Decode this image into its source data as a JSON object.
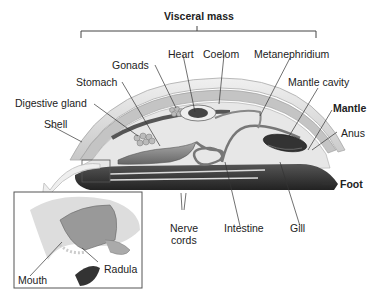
{
  "title": "Visceral mass",
  "labels": {
    "visceral_mass": "Visceral mass",
    "heart": "Heart",
    "coelom": "Coelom",
    "metanephridium": "Metanephridium",
    "gonads": "Gonads",
    "stomach": "Stomach",
    "mantle_cavity": "Mantle cavity",
    "digestive_gland": "Digestive gland",
    "mantle": "Mantle",
    "shell": "Shell",
    "anus": "Anus",
    "foot": "Foot",
    "nerve_cords_1": "Nerve",
    "nerve_cords_2": "cords",
    "intestine": "Intestine",
    "gill": "Gill",
    "mouth": "Mouth",
    "radula": "Radula"
  },
  "colors": {
    "shell": "#d9d9d9",
    "mantle": "#bdbdbd",
    "foot": "#3a3a3a",
    "organs": "#8a8a8a",
    "line": "#333333"
  }
}
